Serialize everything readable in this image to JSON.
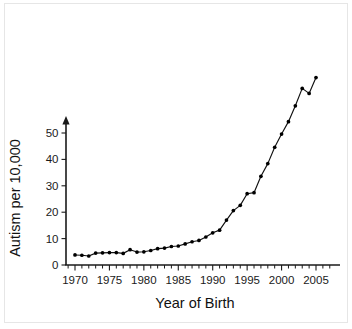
{
  "chart_data": {
    "type": "line",
    "title": "",
    "xlabel": "Year of Birth",
    "ylabel": "Autism per 10,000",
    "xlim": [
      1967,
      2008
    ],
    "ylim": [
      0,
      57
    ],
    "grid": false,
    "legend": null,
    "x_major_ticks": [
      1970,
      1975,
      1980,
      1985,
      1990,
      1995,
      2000,
      2005
    ],
    "x_major_tick_labels": [
      "1970",
      "1975",
      "1980",
      "1985",
      "1990",
      "1995",
      "2000",
      "2005"
    ],
    "x_minor_tick_step": 1,
    "y_ticks": [
      0,
      10,
      20,
      30,
      40,
      50
    ],
    "y_tick_labels": [
      "0",
      "10",
      "20",
      "30",
      "40",
      "50"
    ],
    "marker": "filled-circle",
    "line_color": "#111111",
    "marker_color": "#000000",
    "x": [
      1970,
      1971,
      1972,
      1973,
      1974,
      1975,
      1976,
      1977,
      1978,
      1979,
      1980,
      1981,
      1982,
      1983,
      1984,
      1985,
      1986,
      1987,
      1988,
      1989,
      1990,
      1991,
      1992,
      1993,
      1994,
      1995,
      1996,
      1997,
      1998,
      1999,
      2000,
      2001,
      2002,
      2003,
      2004,
      2005
    ],
    "values": [
      3.8,
      3.7,
      3.4,
      4.5,
      4.6,
      4.7,
      4.7,
      4.4,
      5.8,
      4.9,
      5.0,
      5.5,
      6.2,
      6.4,
      7.0,
      7.2,
      8.0,
      8.8,
      9.3,
      10.6,
      12.2,
      13.2,
      17.0,
      20.6,
      22.6,
      27.0,
      27.4,
      33.6,
      38.4,
      44.6,
      49.6,
      54.3,
      60.3,
      66.9,
      65.0,
      71.0
    ],
    "series": [
      {
        "name": "Autism per 10,000",
        "values": [
          3.8,
          3.7,
          3.4,
          4.5,
          4.6,
          4.7,
          4.7,
          4.4,
          5.8,
          4.9,
          5.0,
          5.5,
          6.2,
          6.4,
          7.0,
          7.2,
          8.0,
          8.8,
          9.3,
          10.6,
          12.2,
          13.2,
          17.0,
          20.6,
          22.6,
          27.0,
          27.4,
          33.6,
          38.4,
          44.6,
          49.6,
          54.3,
          60.3,
          66.9,
          65.0,
          71.0
        ]
      }
    ],
    "notes": {
      "y_axis_style": "arrow-terminated axis extending above the highest labeled tick",
      "overflow": "data points above 1999 extend beyond the top of the labeled y-axis range",
      "local_peak_year": 2003,
      "local_dip_year": 2004,
      "max_year": 2005
    }
  }
}
